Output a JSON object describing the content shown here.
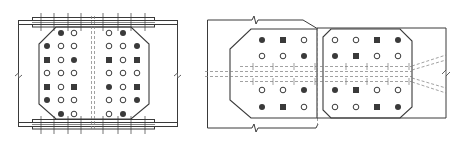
{
  "figure": {
    "stroke_color": "#3a3a3a",
    "hidden_line_color": "#7a7a7a",
    "background": "#ffffff"
  },
  "legend_symbols": {
    "filled_circle": "bolt (filled)",
    "open_circle": "bolt hole (open)",
    "filled_square": "bolt (square)"
  },
  "left_detail": {
    "name": "flange-gusset-splice",
    "bolt_columns_x": [
      47,
      61,
      74,
      109,
      123,
      137
    ],
    "bolt_rows_y": [
      33,
      46,
      60,
      73,
      87,
      100,
      114
    ],
    "bolt_grid": [
      [
        "none",
        "filled_circle",
        "open_circle",
        "open_circle",
        "filled_circle",
        "none"
      ],
      [
        "filled_circle",
        "open_circle",
        "open_circle",
        "open_circle",
        "open_circle",
        "filled_circle"
      ],
      [
        "filled_square",
        "open_circle",
        "filled_circle",
        "filled_square",
        "open_circle",
        "filled_square"
      ],
      [
        "open_circle",
        "open_circle",
        "open_circle",
        "open_circle",
        "open_circle",
        "open_circle"
      ],
      [
        "filled_square",
        "open_circle",
        "filled_square",
        "filled_circle",
        "open_circle",
        "filled_square"
      ],
      [
        "filled_circle",
        "open_circle",
        "open_circle",
        "open_circle",
        "open_circle",
        "filled_circle"
      ],
      [
        "none",
        "filled_circle",
        "open_circle",
        "open_circle",
        "filled_circle",
        "none"
      ]
    ],
    "flange_bolt_lines_x": [
      41,
      54,
      68,
      81,
      103,
      118,
      131,
      145
    ]
  },
  "right_detail": {
    "name": "bracing-gusset-splice",
    "bolt_rows_y": [
      40,
      56,
      90,
      107
    ],
    "left_plate": {
      "bolt_columns_x": [
        262,
        283,
        304
      ],
      "bolt_grid": [
        [
          "filled_circle",
          "filled_square",
          "open_circle"
        ],
        [
          "open_circle",
          "open_circle",
          "filled_circle"
        ],
        [
          "open_circle",
          "open_circle",
          "filled_circle"
        ],
        [
          "filled_circle",
          "filled_square",
          "open_circle"
        ]
      ]
    },
    "right_plate": {
      "bolt_columns_x": [
        335,
        356,
        377,
        398
      ],
      "bolt_grid": [
        [
          "open_circle",
          "open_circle",
          "filled_square",
          "filled_circle"
        ],
        [
          "filled_circle",
          "filled_square",
          "open_circle",
          "open_circle"
        ],
        [
          "filled_circle",
          "filled_square",
          "open_circle",
          "open_circle"
        ],
        [
          "open_circle",
          "open_circle",
          "filled_square",
          "filled_circle"
        ]
      ]
    },
    "hidden_bolt_lines_x": [
      253,
      273,
      294,
      315,
      346,
      367,
      388,
      409
    ]
  }
}
